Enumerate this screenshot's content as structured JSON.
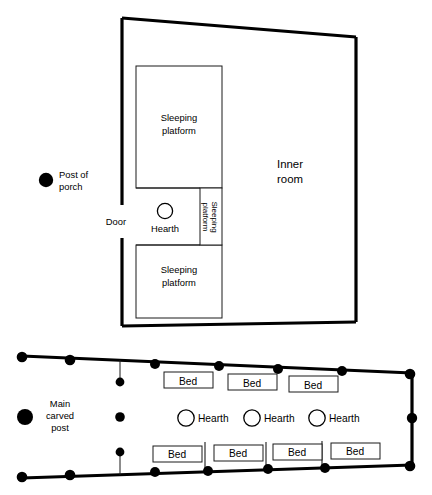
{
  "figure": {
    "colors": {
      "ink": "#000000",
      "wall": "#1a1a1a",
      "background": "#ffffff"
    }
  },
  "upper_plan": {
    "name": "Plank house plan",
    "labels": {
      "inner_room": "Inner\nroom",
      "inner_room_line1": "Inner",
      "inner_room_line2": "room",
      "sleeping_platform_top_line1": "Sleeping",
      "sleeping_platform_top_line2": "platform",
      "sleeping_platform_bottom_line1": "Sleeping",
      "sleeping_platform_bottom_line2": "platform",
      "sleeping_platform_vertical_line1": "Sleeping",
      "sleeping_platform_vertical_line2": "platform",
      "hearth": "Hearth",
      "door": "Door",
      "post_of_porch_line1": "Post of",
      "post_of_porch_line2": "porch"
    }
  },
  "lower_plan": {
    "name": "Longhouse plan",
    "labels": {
      "main_carved_post_line1": "Main",
      "main_carved_post_line2": "carved",
      "main_carved_post_line3": "post",
      "hearth": "Hearth",
      "bed": "Bed"
    },
    "beds_top": [
      "Bed",
      "Bed",
      "Bed"
    ],
    "beds_bottom": [
      "Bed",
      "Bed",
      "Bed",
      "Bed"
    ],
    "hearths": [
      "Hearth",
      "Hearth",
      "Hearth"
    ],
    "counts": {
      "beds_top": 3,
      "beds_bottom": 4,
      "hearths": 3
    }
  }
}
